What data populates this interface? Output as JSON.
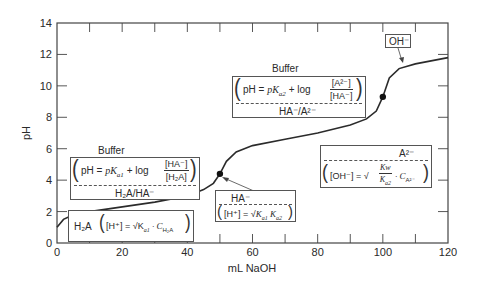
{
  "chart_data": {
    "type": "line",
    "title": "",
    "xlabel": "mL NaOH",
    "ylabel": "pH",
    "xlim": [
      0,
      120
    ],
    "ylim": [
      0,
      14
    ],
    "x_ticks": [
      0,
      20,
      40,
      60,
      80,
      100,
      120
    ],
    "x_tick_labels": [
      "0",
      "20",
      "40",
      "60",
      "80",
      "100",
      "120"
    ],
    "y_ticks": [
      0,
      2,
      4,
      6,
      8,
      10,
      12,
      14
    ],
    "y_tick_labels": [
      "0",
      "2",
      "4",
      "6",
      "8",
      "10",
      "12",
      "14"
    ],
    "grid": false,
    "series": [
      {
        "name": "Titration curve of diprotic acid H2A with NaOH",
        "x": [
          0,
          2,
          5,
          10,
          20,
          30,
          40,
          45,
          48,
          50,
          52,
          55,
          60,
          70,
          80,
          90,
          95,
          98,
          100,
          102,
          105,
          110,
          120
        ],
        "y": [
          1.0,
          1.5,
          1.8,
          2.0,
          2.3,
          2.6,
          3.0,
          3.4,
          3.8,
          4.4,
          5.2,
          5.8,
          6.2,
          6.6,
          7.0,
          7.5,
          7.9,
          8.4,
          9.3,
          10.5,
          11.1,
          11.4,
          11.8
        ]
      }
    ],
    "marked_points": [
      {
        "x": 50,
        "y": 4.4,
        "label": "HA⁻ equivalence point"
      },
      {
        "x": 100,
        "y": 9.3,
        "label": "A²⁻ equivalence point"
      }
    ],
    "annotations": [
      {
        "id": "initial",
        "species": "H₂A",
        "equation": "[H⁺] = √(K_a1 · C_H₂A)",
        "region_x": [
          0,
          40
        ]
      },
      {
        "id": "buffer1",
        "title": "Buffer",
        "equation": "pH = pK_a1 + log [HA⁻]/[H₂A]",
        "pair": "H₂A/HA⁻"
      },
      {
        "id": "first_eq",
        "species": "HA⁻",
        "equation": "[H⁺] = √(K_a1 K_a2)"
      },
      {
        "id": "buffer2",
        "title": "Buffer",
        "equation": "pH = pK_a2 + log [A²⁻]/[HA⁻]",
        "pair": "HA⁻/A²⁻"
      },
      {
        "id": "second_eq",
        "species": "A²⁻",
        "equation": "[OH⁻] = √(Kw/K_a2 · C_A²⁻)"
      },
      {
        "id": "excess",
        "species": "OH⁻"
      }
    ]
  },
  "labels": {
    "xlabel": "mL NaOH",
    "ylabel": "pH",
    "buffer1_title": "Buffer",
    "buffer1_lhs": "pH = ",
    "buffer1_pk": "pK",
    "buffer1_pk_sub": "a1",
    "buffer1_log": " + log",
    "buffer1_num": "[HA⁻]",
    "buffer1_den": "[H₂A]",
    "buffer1_pair": "H₂A/HA⁻",
    "buffer2_title": "Buffer",
    "buffer2_lhs": "pH = ",
    "buffer2_pk": "pK",
    "buffer2_pk_sub": "a2",
    "buffer2_log": " + log",
    "buffer2_num": "[A²⁻]",
    "buffer2_den": "[HA⁻]",
    "buffer2_pair": "HA⁻/A²⁻",
    "initial_species": "H₂A",
    "initial_eq": "[H⁺] = √K",
    "initial_sub": "a1",
    "initial_tail": " · C",
    "initial_tail_sub": "H₂A",
    "first_eq_species": "HA⁻",
    "first_eq_lhs": "[H⁺] = √",
    "first_eq_k1": "K",
    "first_eq_k1_sub": "a1",
    "first_eq_k2": " K",
    "first_eq_k2_sub": "a2",
    "second_eq_species": "A²⁻",
    "second_eq_lhs": "[OH⁻] = √",
    "second_eq_num": "Kw",
    "second_eq_den": "K",
    "second_eq_den_sub": "a2",
    "second_eq_tail": " · C",
    "second_eq_tail_sub": "A²⁻",
    "excess_species": "OH⁻"
  },
  "colors": {
    "axis": "#444444",
    "curve": "#2b2b2b",
    "text": "#2a2a2a",
    "box_border": "#555555"
  }
}
